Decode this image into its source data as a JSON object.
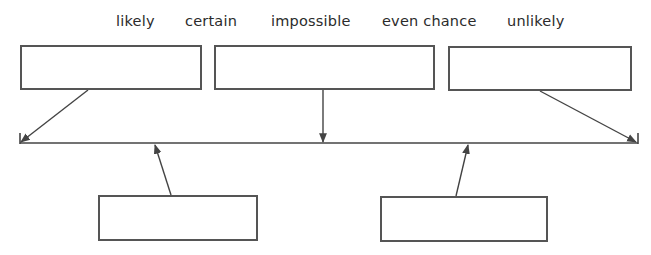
{
  "word_bank": [
    {
      "label": "likely",
      "x": 116
    },
    {
      "label": "certain",
      "x": 185
    },
    {
      "label": "impossible",
      "x": 271
    },
    {
      "label": "even chance",
      "x": 382
    },
    {
      "label": "unlikely",
      "x": 507
    }
  ],
  "answer_boxes": [
    {
      "id": "box-top-left",
      "x": 20,
      "y": 45,
      "w": 182,
      "h": 45,
      "value": ""
    },
    {
      "id": "box-top-middle",
      "x": 214,
      "y": 45,
      "w": 221,
      "h": 45,
      "value": ""
    },
    {
      "id": "box-top-right",
      "x": 448,
      "y": 46,
      "w": 184,
      "h": 45,
      "value": ""
    },
    {
      "id": "box-bottom-left",
      "x": 98,
      "y": 195,
      "w": 160,
      "h": 46,
      "value": ""
    },
    {
      "id": "box-bottom-right",
      "x": 380,
      "y": 196,
      "w": 168,
      "h": 46,
      "value": ""
    }
  ],
  "number_line": {
    "x1": 20,
    "x2": 638,
    "y": 143,
    "tick_height": 10
  },
  "arrows": [
    {
      "from": "box-top-left",
      "x1": 88,
      "y1": 90,
      "x2": 21,
      "y2": 142
    },
    {
      "from": "box-top-middle",
      "x1": 323,
      "y1": 90,
      "x2": 323,
      "y2": 142
    },
    {
      "from": "box-top-right",
      "x1": 540,
      "y1": 91,
      "x2": 636,
      "y2": 142
    },
    {
      "from": "box-bottom-left",
      "x1": 171,
      "y1": 195,
      "x2": 155,
      "y2": 145
    },
    {
      "from": "box-bottom-right",
      "x1": 456,
      "y1": 196,
      "x2": 468,
      "y2": 145
    }
  ],
  "colors": {
    "line": "#444444",
    "box_border": "#555555",
    "text": "#2b2b2b"
  }
}
